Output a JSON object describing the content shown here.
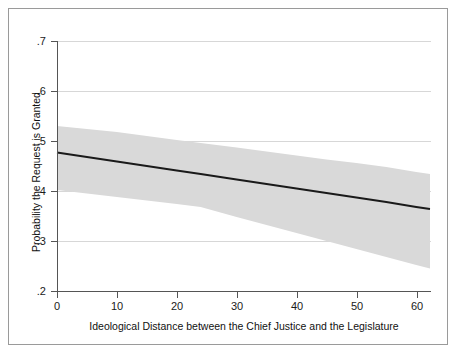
{
  "figure": {
    "background_color": "#ffffff",
    "frame_color": "#9a9a9a"
  },
  "chart_data": {
    "type": "line",
    "title": "",
    "subtitle": "",
    "xlabel": "Ideological Distance between the Chief Justice and the Legislature",
    "ylabel": "Probability the Request is Granted",
    "xlim": [
      0,
      62.3
    ],
    "ylim": [
      0.2,
      0.7
    ],
    "xticks": [
      0,
      10,
      20,
      30,
      40,
      50,
      60
    ],
    "xtick_labels": [
      "0",
      "10",
      "20",
      "30",
      "40",
      "50",
      "60"
    ],
    "yticks": [
      0.7,
      0.6,
      0.5,
      0.4,
      0.3,
      0.2
    ],
    "ytick_labels": [
      ".7",
      ".6",
      ".5",
      ".4",
      ".3",
      ".2"
    ],
    "grid": "horizontal",
    "grid_color": "#d7d7d7",
    "legend": "none",
    "line_color": "#1a1a1a",
    "band_color": "#d9d9d9",
    "band_label": "95% confidence interval",
    "series": [
      {
        "name": "Predicted probability",
        "x": [
          0,
          5,
          10,
          15,
          20,
          24,
          30,
          35,
          40,
          45,
          50,
          55,
          60,
          62.3
        ],
        "values": [
          0.477,
          0.468,
          0.459,
          0.45,
          0.441,
          0.434,
          0.423,
          0.414,
          0.405,
          0.396,
          0.387,
          0.378,
          0.368,
          0.364
        ]
      },
      {
        "name": "Upper 95% bound",
        "x": [
          0,
          5,
          10,
          15,
          20,
          24,
          30,
          35,
          40,
          45,
          50,
          55,
          60,
          62.3
        ],
        "values": [
          0.53,
          0.524,
          0.518,
          0.51,
          0.502,
          0.496,
          0.487,
          0.479,
          0.471,
          0.463,
          0.456,
          0.448,
          0.438,
          0.434
        ]
      },
      {
        "name": "Lower 95% bound",
        "x": [
          0,
          5,
          10,
          15,
          20,
          24,
          30,
          35,
          40,
          45,
          50,
          55,
          60,
          62.3
        ],
        "values": [
          0.402,
          0.395,
          0.388,
          0.381,
          0.374,
          0.368,
          0.348,
          0.332,
          0.316,
          0.3,
          0.284,
          0.268,
          0.252,
          0.245
        ]
      }
    ],
    "annotations": []
  }
}
